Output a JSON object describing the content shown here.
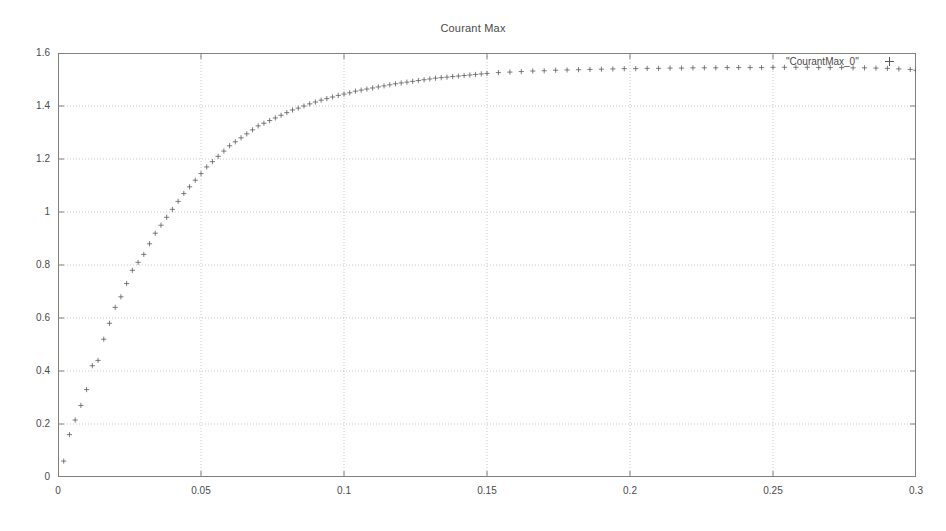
{
  "chart_data": {
    "type": "scatter",
    "title": "Courant Max",
    "xlabel": "",
    "ylabel": "",
    "xlim": [
      0,
      0.3
    ],
    "ylim": [
      0,
      1.6
    ],
    "grid": true,
    "legend_position": "top-right",
    "marker": "plus",
    "series": [
      {
        "name": "\"CourantMax_0\"",
        "x": [
          0.002,
          0.004,
          0.006,
          0.008,
          0.01,
          0.012,
          0.014,
          0.016,
          0.018,
          0.02,
          0.022,
          0.024,
          0.026,
          0.028,
          0.03,
          0.032,
          0.034,
          0.036,
          0.038,
          0.04,
          0.042,
          0.044,
          0.046,
          0.048,
          0.05,
          0.052,
          0.054,
          0.056,
          0.058,
          0.06,
          0.062,
          0.064,
          0.066,
          0.068,
          0.07,
          0.072,
          0.074,
          0.076,
          0.078,
          0.08,
          0.082,
          0.084,
          0.086,
          0.088,
          0.09,
          0.092,
          0.094,
          0.096,
          0.098,
          0.1,
          0.102,
          0.104,
          0.106,
          0.108,
          0.11,
          0.112,
          0.114,
          0.116,
          0.118,
          0.12,
          0.122,
          0.124,
          0.126,
          0.128,
          0.13,
          0.132,
          0.134,
          0.136,
          0.138,
          0.14,
          0.142,
          0.144,
          0.146,
          0.148,
          0.15,
          0.154,
          0.158,
          0.162,
          0.166,
          0.17,
          0.174,
          0.178,
          0.182,
          0.186,
          0.19,
          0.194,
          0.198,
          0.202,
          0.206,
          0.21,
          0.214,
          0.218,
          0.222,
          0.226,
          0.23,
          0.234,
          0.238,
          0.242,
          0.246,
          0.25,
          0.254,
          0.258,
          0.262,
          0.266,
          0.27,
          0.274,
          0.278,
          0.282,
          0.286,
          0.29,
          0.294,
          0.298,
          0.3
        ],
        "y": [
          0.06,
          0.16,
          0.215,
          0.27,
          0.33,
          0.42,
          0.44,
          0.52,
          0.58,
          0.64,
          0.68,
          0.73,
          0.78,
          0.81,
          0.84,
          0.88,
          0.92,
          0.95,
          0.98,
          1.01,
          1.04,
          1.07,
          1.095,
          1.12,
          1.145,
          1.17,
          1.19,
          1.21,
          1.23,
          1.25,
          1.265,
          1.28,
          1.295,
          1.31,
          1.325,
          1.335,
          1.345,
          1.355,
          1.365,
          1.375,
          1.385,
          1.392,
          1.4,
          1.408,
          1.415,
          1.422,
          1.428,
          1.434,
          1.44,
          1.445,
          1.45,
          1.456,
          1.46,
          1.464,
          1.468,
          1.472,
          1.476,
          1.48,
          1.484,
          1.487,
          1.49,
          1.493,
          1.496,
          1.499,
          1.502,
          1.505,
          1.507,
          1.509,
          1.511,
          1.513,
          1.515,
          1.517,
          1.519,
          1.521,
          1.523,
          1.526,
          1.528,
          1.53,
          1.532,
          1.533,
          1.535,
          1.536,
          1.537,
          1.538,
          1.539,
          1.54,
          1.541,
          1.541,
          1.542,
          1.542,
          1.543,
          1.543,
          1.544,
          1.544,
          1.544,
          1.545,
          1.545,
          1.545,
          1.545,
          1.546,
          1.546,
          1.546,
          1.546,
          1.545,
          1.545,
          1.545,
          1.544,
          1.544,
          1.543,
          1.542,
          1.54,
          1.538,
          1.535
        ]
      }
    ],
    "yticks": [
      {
        "value": 0,
        "label": "0"
      },
      {
        "value": 0.2,
        "label": "0.2"
      },
      {
        "value": 0.4,
        "label": "0.4"
      },
      {
        "value": 0.6,
        "label": "0.6"
      },
      {
        "value": 0.8,
        "label": "0.8"
      },
      {
        "value": 1,
        "label": "1"
      },
      {
        "value": 1.2,
        "label": "1.2"
      },
      {
        "value": 1.4,
        "label": "1.4"
      },
      {
        "value": 1.6,
        "label": "1.6"
      }
    ],
    "xticks": [
      {
        "value": 0,
        "label": "0"
      },
      {
        "value": 0.05,
        "label": "0.05"
      },
      {
        "value": 0.1,
        "label": "0.1"
      },
      {
        "value": 0.15,
        "label": "0.15"
      },
      {
        "value": 0.2,
        "label": "0.2"
      },
      {
        "value": 0.25,
        "label": "0.25"
      },
      {
        "value": 0.3,
        "label": "0.3"
      }
    ],
    "colors": {
      "background": "#ffffff",
      "axis": "#808080",
      "grid": "#c8c8c8",
      "marker": "#555555",
      "text": "#4a4a4a"
    }
  }
}
